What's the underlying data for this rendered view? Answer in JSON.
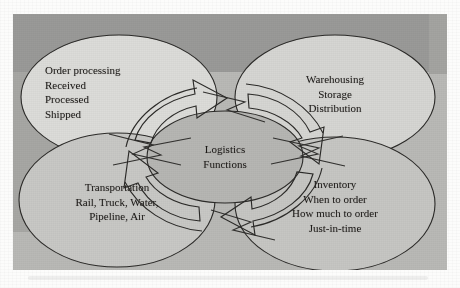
{
  "figure": {
    "frame": {
      "x": 13,
      "y": 14,
      "width": 434,
      "height": 256
    },
    "colors": {
      "band_top": "#9a9a98",
      "band_bottom": "#b9b9b6",
      "ellipse_fill_light": "#d8d8d5",
      "ellipse_fill_mid": "#c2c2bf",
      "center_fill": "#b6b6b3",
      "stroke": "#2b2a28",
      "text": "#1c1a18",
      "paper": "#fcfcfb"
    }
  },
  "center": {
    "name": "logistics-functions",
    "lines": [
      "Logistics",
      "Functions"
    ],
    "cx": 212,
    "cy": 143,
    "rx": 78,
    "ry": 46
  },
  "nodes": [
    {
      "id": "order-processing",
      "align": "left",
      "cx": 106,
      "cy": 83,
      "rx": 98,
      "ry": 62,
      "fill": "#dcdcd9",
      "lines": [
        "Order processing",
        "Received",
        "Processed",
        "Shipped"
      ]
    },
    {
      "id": "warehousing",
      "align": "center",
      "cx": 322,
      "cy": 83,
      "rx": 100,
      "ry": 62,
      "fill": "#d6d6d3",
      "lines": [
        "Warehousing",
        "Storage",
        "Distribution"
      ]
    },
    {
      "id": "transportation",
      "align": "center",
      "cx": 104,
      "cy": 186,
      "rx": 98,
      "ry": 67,
      "fill": "#c8c8c5",
      "lines": [
        "Transportation",
        "Rail, Truck, Water,",
        "Pipeline, Air"
      ]
    },
    {
      "id": "inventory",
      "align": "center",
      "cx": 322,
      "cy": 190,
      "rx": 100,
      "ry": 67,
      "fill": "#c6c6c3",
      "lines": [
        "Inventory",
        "When to order",
        "How much to order",
        "Just-in-time"
      ]
    }
  ],
  "arrows": [
    {
      "id": "arrow-left-up",
      "label": "curved block arrow pointing up-right toward order processing"
    },
    {
      "id": "arrow-top-right",
      "label": "curved block arrow pointing right toward warehousing"
    },
    {
      "id": "arrow-right-down",
      "label": "curved block arrow pointing down toward inventory"
    },
    {
      "id": "arrow-bottom-left",
      "label": "curved block arrow pointing left toward transportation"
    }
  ]
}
